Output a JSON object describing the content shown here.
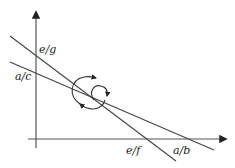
{
  "diagram": {
    "type": "line-rotation-diagram",
    "axes": {
      "x_axis": "horizontal axis",
      "y_axis": "vertical axis"
    },
    "lines": [
      {
        "id": "steep",
        "y_intercept_label": "e/g",
        "x_intercept_label": "e/f"
      },
      {
        "id": "shallow",
        "y_intercept_label": "a/c",
        "x_intercept_label": "a/b"
      }
    ],
    "labels": {
      "eg": "e/g",
      "ac": "a/c",
      "ef": "e/f",
      "ab": "a/b"
    },
    "rotation_arrows": "clockwise/counter-clockwise rotation about intersection point",
    "colors": {
      "stroke": "#333333",
      "background": "#ffffff"
    }
  }
}
